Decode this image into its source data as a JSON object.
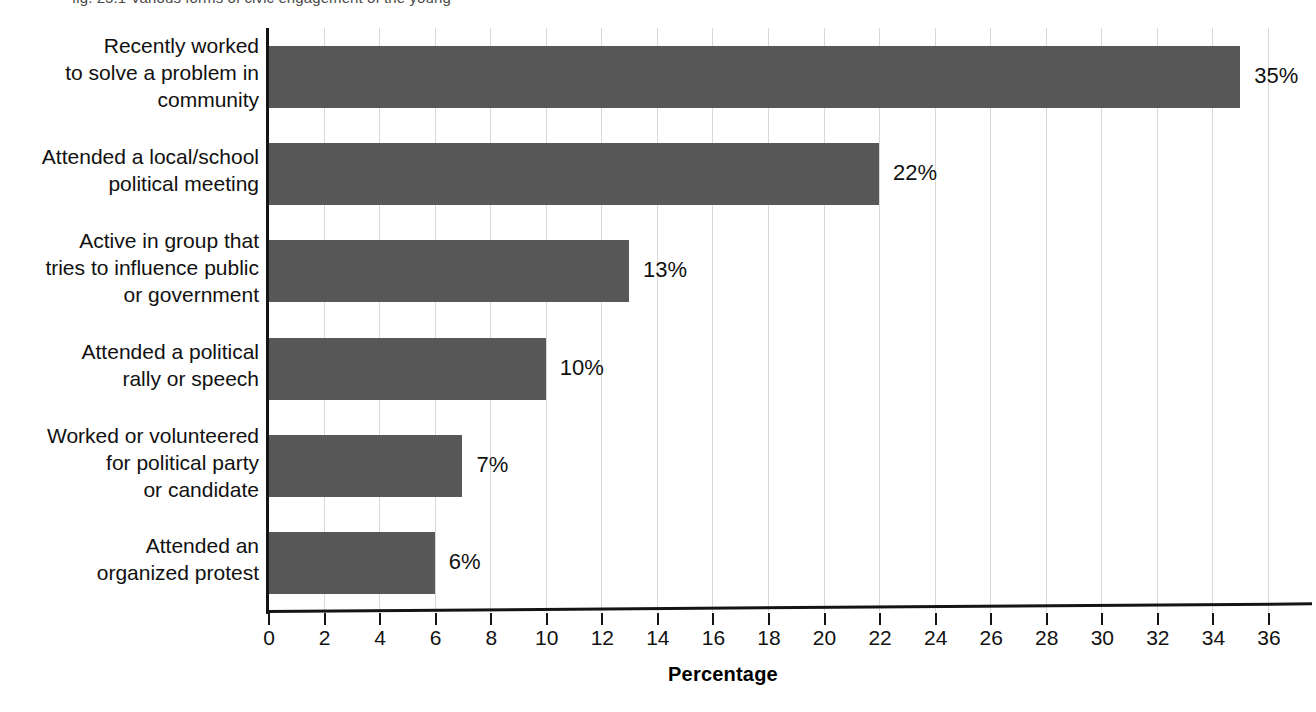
{
  "figure": {
    "caption_partial": "fig. 25.1 Various forms of civic engagement of the young",
    "xtitle": "Percentage"
  },
  "chart_data": {
    "type": "bar",
    "orientation": "horizontal",
    "title": "",
    "subtitle": "",
    "xlabel": "Percentage",
    "ylabel": "",
    "xlim": [
      0,
      36
    ],
    "ylim": null,
    "grid": "vertical",
    "legend": null,
    "bar_color": "#585858",
    "xticks": [
      0,
      2,
      4,
      6,
      8,
      10,
      12,
      14,
      16,
      18,
      20,
      22,
      24,
      26,
      28,
      30,
      32,
      34,
      36
    ],
    "xticklabels": [
      "0",
      "2",
      "4",
      "6",
      "8",
      "10",
      "12",
      "14",
      "16",
      "18",
      "20",
      "22",
      "24",
      "26",
      "28",
      "30",
      "32",
      "34",
      "36"
    ],
    "categories": [
      "Recently worked to solve a problem in community",
      "Attended a local/school political meeting",
      "Active in group that tries to influence public or government",
      "Attended a political rally or speech",
      "Worked or volunteered for political party or candidate",
      "Attended an organized protest"
    ],
    "category_lines": [
      [
        "Recently worked",
        "to solve a problem in",
        "community"
      ],
      [
        "Attended a local/school",
        "political meeting"
      ],
      [
        "Active in group that",
        "tries to influence public",
        "or government"
      ],
      [
        "Attended a political",
        "rally or speech"
      ],
      [
        "Worked or volunteered",
        "for political party",
        "or candidate"
      ],
      [
        "Attended an",
        "organized protest"
      ]
    ],
    "values": [
      35,
      22,
      13,
      10,
      7,
      6
    ],
    "value_labels": [
      "35%",
      "22%",
      "13%",
      "10%",
      "7%",
      "6%"
    ]
  }
}
